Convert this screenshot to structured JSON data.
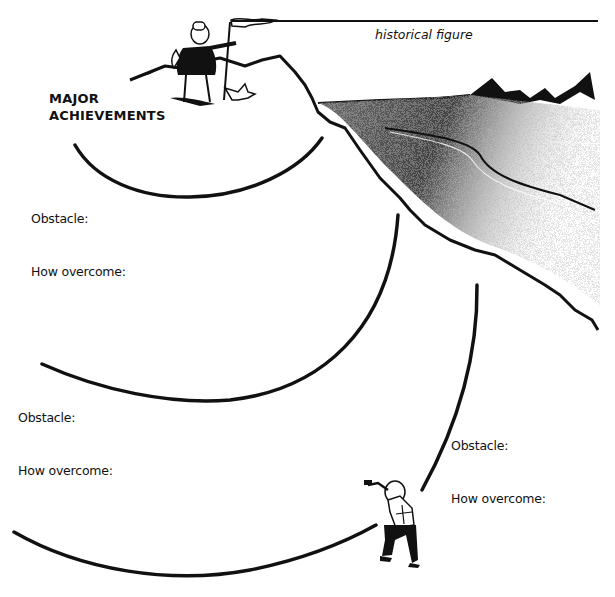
{
  "worksheet": {
    "name_line_caption": "historical figure",
    "achievements": {
      "line1": "MAJOR",
      "line2": "ACHIEVEMENTS"
    },
    "sections": [
      {
        "obstacle_label": "Obstacle:",
        "how_label": "How overcome:"
      },
      {
        "obstacle_label": "Obstacle:",
        "how_label": "How overcome:"
      },
      {
        "obstacle_label": "Obstacle:",
        "how_label": "How overcome:"
      }
    ]
  },
  "illustrations": {
    "summit": "hiker-with-flag-and-dog",
    "mountain": "mountain-with-glacier",
    "climber": "climbing-hiker"
  },
  "colors": {
    "ink": "#111111",
    "paper": "#ffffff"
  }
}
